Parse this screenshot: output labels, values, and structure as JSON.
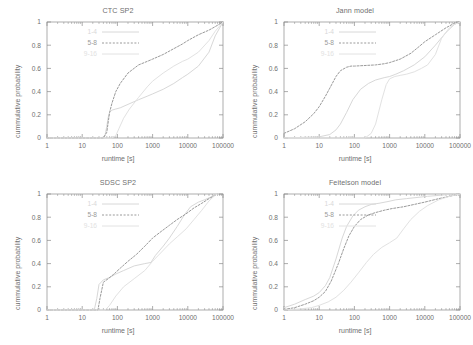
{
  "figure": {
    "layout": "2x2 grid of CDF plots",
    "background": "#ffffff",
    "axis_color": "#8a8a8a",
    "text_color": "#6f6f6f"
  },
  "axes": {
    "xlabel": "runtime [s]",
    "ylabel": "cummulative probability",
    "x_ticks": [
      "1",
      "10",
      "100",
      "1000",
      "10000",
      "100000"
    ],
    "y_ticks": [
      "0",
      "0.2",
      "0.4",
      "0.6",
      "0.8",
      "1"
    ]
  },
  "legend": {
    "entries": [
      {
        "label": "1-4",
        "style": "solid",
        "color": "#d8d8d8"
      },
      {
        "label": "5-8",
        "style": "dashed",
        "color": "#9a9a9a"
      },
      {
        "label": "9-16",
        "style": "solid",
        "color": "#e2e2e2"
      }
    ]
  },
  "chart_data": [
    {
      "type": "line",
      "title": "CTC SP2",
      "xlabel": "runtime [s]",
      "ylabel": "cummulative probability",
      "xscale": "log",
      "xlim": [
        1,
        100000
      ],
      "ylim": [
        0,
        1
      ],
      "grid": false,
      "legend_position": "upper-left",
      "series": [
        {
          "name": "1-4",
          "style": "solid",
          "color": "#d8d8d8",
          "x": [
            1,
            40,
            45,
            50,
            55,
            60,
            70,
            90,
            120,
            200,
            400,
            700,
            1000,
            2000,
            4000,
            7000,
            10000,
            20000,
            40000,
            60000,
            100000
          ],
          "y": [
            0,
            0,
            0.03,
            0.1,
            0.18,
            0.22,
            0.24,
            0.25,
            0.26,
            0.29,
            0.33,
            0.36,
            0.38,
            0.42,
            0.47,
            0.52,
            0.55,
            0.62,
            0.74,
            0.88,
            1.0
          ]
        },
        {
          "name": "5-8",
          "style": "dashed",
          "color": "#9a9a9a",
          "x": [
            1,
            40,
            50,
            55,
            60,
            70,
            90,
            120,
            200,
            400,
            700,
            1000,
            2000,
            4000,
            7000,
            10000,
            20000,
            40000,
            60000,
            100000
          ],
          "y": [
            0,
            0,
            0.05,
            0.14,
            0.22,
            0.3,
            0.4,
            0.47,
            0.56,
            0.63,
            0.66,
            0.68,
            0.72,
            0.77,
            0.81,
            0.84,
            0.89,
            0.93,
            0.96,
            1.0
          ]
        },
        {
          "name": "9-16",
          "style": "solid",
          "color": "#e2e2e2",
          "x": [
            1,
            70,
            90,
            110,
            150,
            220,
            400,
            700,
            1000,
            2000,
            4000,
            7000,
            10000,
            20000,
            40000,
            60000,
            100000
          ],
          "y": [
            0,
            0,
            0.02,
            0.08,
            0.17,
            0.25,
            0.35,
            0.44,
            0.49,
            0.56,
            0.62,
            0.66,
            0.68,
            0.74,
            0.84,
            0.92,
            1.0
          ]
        }
      ]
    },
    {
      "type": "line",
      "title": "Jann model",
      "xlabel": "runtime [s]",
      "ylabel": "cummulative probability",
      "xscale": "log",
      "xlim": [
        1,
        100000
      ],
      "ylim": [
        0,
        1
      ],
      "grid": false,
      "legend_position": "upper-left",
      "series": [
        {
          "name": "1-4",
          "style": "solid",
          "color": "#d8d8d8",
          "x": [
            1,
            10,
            20,
            30,
            40,
            60,
            90,
            150,
            250,
            400,
            700,
            1000,
            1500,
            2500,
            5000,
            10000,
            20000,
            40000,
            70000,
            100000
          ],
          "y": [
            0,
            0.01,
            0.03,
            0.07,
            0.12,
            0.22,
            0.33,
            0.42,
            0.47,
            0.5,
            0.52,
            0.53,
            0.55,
            0.58,
            0.63,
            0.7,
            0.8,
            0.91,
            0.98,
            1.0
          ]
        },
        {
          "name": "5-8",
          "style": "dashed",
          "color": "#9a9a9a",
          "x": [
            1,
            2,
            4,
            7,
            10,
            15,
            20,
            30,
            40,
            60,
            80,
            100,
            200,
            400,
            700,
            1000,
            2000,
            4000,
            7000,
            10000,
            20000,
            40000,
            70000,
            100000
          ],
          "y": [
            0.04,
            0.08,
            0.14,
            0.21,
            0.27,
            0.36,
            0.43,
            0.53,
            0.58,
            0.61,
            0.62,
            0.62,
            0.625,
            0.63,
            0.64,
            0.65,
            0.68,
            0.73,
            0.79,
            0.83,
            0.89,
            0.95,
            0.99,
            1.0
          ]
        },
        {
          "name": "9-16",
          "style": "solid",
          "color": "#e2e2e2",
          "x": [
            1,
            200,
            300,
            400,
            600,
            800,
            1000,
            1400,
            2000,
            3000,
            5000,
            8000,
            12000,
            20000,
            30000,
            50000,
            70000,
            100000
          ],
          "y": [
            0,
            0,
            0.04,
            0.12,
            0.33,
            0.46,
            0.51,
            0.53,
            0.54,
            0.55,
            0.57,
            0.6,
            0.63,
            0.72,
            0.86,
            0.95,
            0.98,
            1.0
          ]
        }
      ]
    },
    {
      "type": "line",
      "title": "SDSC SP2",
      "xlabel": "runtime [s]",
      "ylabel": "cummulative probability",
      "xscale": "log",
      "xlim": [
        1,
        100000
      ],
      "ylim": [
        0,
        1
      ],
      "grid": false,
      "legend_position": "upper-left",
      "series": [
        {
          "name": "1-4",
          "style": "solid",
          "color": "#d8d8d8",
          "x": [
            1,
            22,
            26,
            30,
            40,
            60,
            90,
            150,
            300,
            600,
            900,
            1200,
            2000,
            3000,
            5000,
            8000,
            12000,
            20000,
            30000,
            50000,
            70000
          ],
          "y": [
            0,
            0,
            0.1,
            0.22,
            0.26,
            0.28,
            0.31,
            0.34,
            0.38,
            0.4,
            0.41,
            0.47,
            0.55,
            0.62,
            0.72,
            0.82,
            0.89,
            0.93,
            0.95,
            0.98,
            1.0
          ]
        },
        {
          "name": "5-8",
          "style": "dashed",
          "color": "#9a9a9a",
          "x": [
            1,
            28,
            32,
            40,
            55,
            80,
            120,
            200,
            350,
            600,
            1000,
            1800,
            3000,
            5000,
            9000,
            15000,
            25000,
            40000,
            60000,
            70000
          ],
          "y": [
            0,
            0,
            0.1,
            0.24,
            0.27,
            0.31,
            0.36,
            0.42,
            0.48,
            0.55,
            0.62,
            0.68,
            0.73,
            0.78,
            0.83,
            0.88,
            0.92,
            0.96,
            0.99,
            1.0
          ]
        },
        {
          "name": "9-16",
          "style": "solid",
          "color": "#e2e2e2",
          "x": [
            1,
            45,
            60,
            90,
            150,
            300,
            600,
            1000,
            1800,
            3000,
            5000,
            9000,
            15000,
            25000,
            40000,
            60000,
            70000
          ],
          "y": [
            0,
            0,
            0.04,
            0.12,
            0.2,
            0.27,
            0.34,
            0.42,
            0.5,
            0.57,
            0.63,
            0.7,
            0.78,
            0.86,
            0.94,
            0.99,
            1.0
          ]
        }
      ]
    },
    {
      "type": "line",
      "title": "Feitelson model",
      "xlabel": "runtime [s]",
      "ylabel": "cummulative probability",
      "xscale": "log",
      "xlim": [
        1,
        100000
      ],
      "ylim": [
        0,
        1
      ],
      "grid": false,
      "legend_position": "upper-left",
      "series": [
        {
          "name": "1-4",
          "style": "solid",
          "color": "#d8d8d8",
          "x": [
            1,
            2,
            4,
            7,
            10,
            15,
            20,
            30,
            45,
            60,
            90,
            130,
            200,
            300,
            500,
            900,
            1500,
            3000,
            6000,
            12000,
            30000,
            60000,
            100000
          ],
          "y": [
            0.02,
            0.05,
            0.09,
            0.12,
            0.15,
            0.21,
            0.28,
            0.44,
            0.62,
            0.72,
            0.81,
            0.86,
            0.89,
            0.91,
            0.92,
            0.935,
            0.95,
            0.96,
            0.97,
            0.98,
            0.99,
            1.0,
            1.0
          ]
        },
        {
          "name": "5-8",
          "style": "dashed",
          "color": "#9a9a9a",
          "x": [
            1,
            2,
            4,
            7,
            10,
            15,
            22,
            35,
            50,
            70,
            100,
            150,
            250,
            400,
            700,
            1200,
            2500,
            5000,
            10000,
            25000,
            50000,
            100000
          ],
          "y": [
            0.005,
            0.02,
            0.05,
            0.08,
            0.11,
            0.16,
            0.25,
            0.4,
            0.53,
            0.64,
            0.72,
            0.78,
            0.82,
            0.84,
            0.86,
            0.875,
            0.89,
            0.91,
            0.93,
            0.96,
            0.98,
            1.0
          ]
        },
        {
          "name": "9-16",
          "style": "solid",
          "color": "#e2e2e2",
          "x": [
            1,
            3,
            6,
            10,
            18,
            30,
            50,
            80,
            130,
            220,
            350,
            600,
            1000,
            1600,
            2500,
            4000,
            7000,
            12000,
            25000,
            50000,
            100000
          ],
          "y": [
            0.0,
            0.01,
            0.02,
            0.04,
            0.07,
            0.11,
            0.17,
            0.24,
            0.32,
            0.41,
            0.48,
            0.54,
            0.58,
            0.62,
            0.7,
            0.78,
            0.85,
            0.9,
            0.95,
            0.98,
            1.0
          ]
        }
      ]
    }
  ],
  "panels": [
    {
      "id": "ctc-sp2",
      "x": 0,
      "y": 0
    },
    {
      "id": "jann-model",
      "x": 237,
      "y": 0
    },
    {
      "id": "sdsc-sp2",
      "x": 0,
      "y": 172
    },
    {
      "id": "feitelson-model",
      "x": 237,
      "y": 172
    }
  ]
}
